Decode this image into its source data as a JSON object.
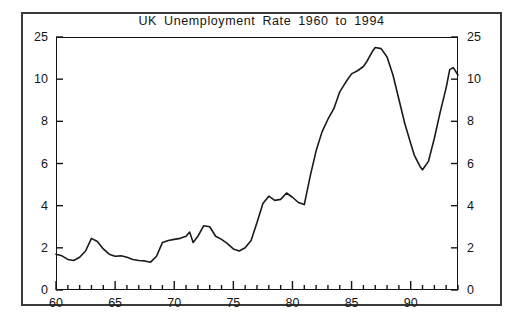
{
  "figure": {
    "title": "UK  Unemployment  Rate   1960  to  1994",
    "background_color": "#ffffff",
    "line_color": "#1a1a1a",
    "axis_color": "#141414",
    "frame_color": "#3a3a3a"
  },
  "axes": {
    "y_left_labels": [
      "25",
      "10",
      "8",
      "6",
      "4",
      "2",
      "0"
    ],
    "y_right_labels": [
      "25",
      "10",
      "8",
      "6",
      "4",
      "2",
      "0"
    ],
    "x_labels": [
      "60",
      "65",
      "70",
      "75",
      "80",
      "85",
      "90"
    ]
  },
  "chart_data": {
    "type": "line",
    "title": "UK  Unemployment  Rate   1960  to  1994",
    "xlabel": "",
    "ylabel": "",
    "xlim": [
      1960,
      1994
    ],
    "ylim": [
      0,
      12
    ],
    "y_tick_values": [
      0,
      2,
      4,
      6,
      8,
      10,
      12
    ],
    "y_tick_labels": [
      "0",
      "2",
      "4",
      "6",
      "8",
      "10",
      "25"
    ],
    "y_top_label_note": "top tick printed as 25 in the scan; tick spacing implies 12",
    "x_tick_values": [
      1960,
      1965,
      1970,
      1975,
      1980,
      1985,
      1990
    ],
    "x_tick_labels": [
      "60",
      "65",
      "70",
      "75",
      "80",
      "85",
      "90"
    ],
    "x_minor_tick_interval": 1,
    "grid": false,
    "legend": null,
    "series": [
      {
        "name": "UK Unemployment Rate",
        "units": "percent",
        "x": [
          1960.0,
          1960.5,
          1961.0,
          1961.5,
          1962.0,
          1962.5,
          1963.0,
          1963.5,
          1964.0,
          1964.5,
          1965.0,
          1965.5,
          1966.0,
          1966.5,
          1967.0,
          1967.5,
          1968.0,
          1968.5,
          1969.0,
          1969.5,
          1970.0,
          1970.5,
          1971.0,
          1971.3,
          1971.6,
          1972.0,
          1972.5,
          1973.0,
          1973.5,
          1974.0,
          1974.5,
          1975.0,
          1975.5,
          1976.0,
          1976.5,
          1977.0,
          1977.5,
          1978.0,
          1978.5,
          1979.0,
          1979.5,
          1980.0,
          1980.5,
          1981.0,
          1981.5,
          1982.0,
          1982.5,
          1983.0,
          1983.5,
          1984.0,
          1984.5,
          1985.0,
          1985.5,
          1986.0,
          1986.3,
          1986.8,
          1987.0,
          1987.5,
          1988.0,
          1988.5,
          1989.0,
          1989.5,
          1990.0,
          1990.3,
          1990.8,
          1991.0,
          1991.5,
          1992.0,
          1992.5,
          1993.0,
          1993.3,
          1993.6,
          1994.0
        ],
        "y": [
          1.7,
          1.62,
          1.45,
          1.4,
          1.55,
          1.85,
          2.45,
          2.3,
          1.95,
          1.7,
          1.6,
          1.62,
          1.55,
          1.45,
          1.4,
          1.38,
          1.32,
          1.6,
          2.25,
          2.35,
          2.4,
          2.45,
          2.55,
          2.75,
          2.25,
          2.55,
          3.05,
          3.0,
          2.55,
          2.4,
          2.2,
          1.95,
          1.85,
          2.0,
          2.35,
          3.2,
          4.1,
          4.45,
          4.25,
          4.3,
          4.6,
          4.4,
          4.15,
          4.05,
          5.4,
          6.6,
          7.5,
          8.1,
          8.6,
          9.4,
          9.85,
          10.25,
          10.4,
          10.6,
          10.85,
          11.35,
          11.5,
          11.45,
          11.05,
          10.2,
          9.05,
          7.9,
          6.95,
          6.4,
          5.85,
          5.7,
          6.1,
          7.2,
          8.45,
          9.6,
          10.45,
          10.55,
          10.2
        ]
      }
    ],
    "annotations": [],
    "key_features": {
      "first_peak": {
        "year": 1986.8,
        "value": 11.5
      },
      "mid_trough": {
        "year": 1990.9,
        "value": 5.7
      },
      "second_peak": {
        "year": 1993.5,
        "value": 10.6
      },
      "start_value": {
        "year": 1960,
        "value": 1.7
      },
      "end_value": {
        "year": 1994,
        "value": 10.2
      },
      "lowest_value": {
        "year": 1968.0,
        "value": 1.32
      }
    }
  }
}
